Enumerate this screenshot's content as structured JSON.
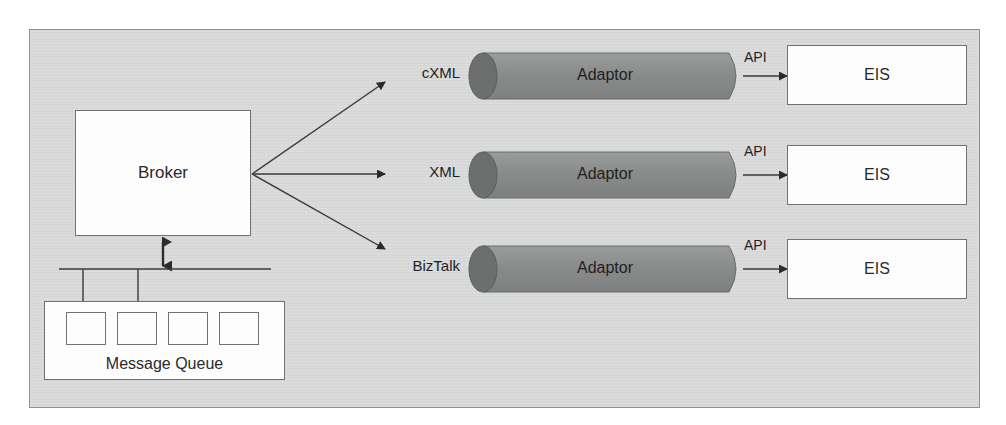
{
  "diagram": {
    "broker": {
      "label": "Broker"
    },
    "message_queue": {
      "label": "Message Queue",
      "slot_count": 4,
      "slots": [
        "",
        "",
        "",
        ""
      ]
    },
    "rows": [
      {
        "protocol_label": "cXML",
        "adaptor_label": "Adaptor",
        "api_label": "API",
        "eis_label": "EIS"
      },
      {
        "protocol_label": "XML",
        "adaptor_label": "Adaptor",
        "api_label": "API",
        "eis_label": "EIS"
      },
      {
        "protocol_label": "BizTalk",
        "adaptor_label": "Adaptor",
        "api_label": "API",
        "eis_label": "EIS"
      }
    ],
    "colors": {
      "frame_background": "#d5d6d6",
      "frame_border": "#8e9091",
      "box_fill": "#fdfdfd",
      "box_border": "#6f7172",
      "cylinder_body": "#8a8b8b",
      "cylinder_cap": "#6e6f6f",
      "line": "#3a3a3a",
      "text": "#1f1f1f"
    },
    "icons": {
      "broker_to_mq": "double-headed-arrow-icon",
      "fanout": "fan-out-arrows-icon"
    }
  }
}
